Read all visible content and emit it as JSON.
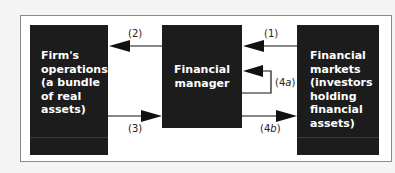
{
  "diagram": {
    "boxes": {
      "left": {
        "lines": [
          "Firm's",
          "operations",
          "(a bundle",
          "of real",
          "assets)"
        ]
      },
      "center": {
        "lines": [
          "Financial",
          "manager"
        ]
      },
      "right": {
        "lines": [
          "Financial",
          "markets",
          "(investors",
          "holding",
          "financial",
          "assets)"
        ]
      }
    },
    "arrows": {
      "a1": {
        "label": "(1)",
        "from": "right",
        "to": "center"
      },
      "a2": {
        "label": "(2)",
        "from": "center",
        "to": "left"
      },
      "a3": {
        "label": "(3)",
        "from": "left",
        "to": "center"
      },
      "a4a": {
        "label_prefix": "(4",
        "label_italic": "a",
        "label_suffix": ")",
        "from": "center",
        "to": "center"
      },
      "a4b": {
        "label_prefix": "(4",
        "label_italic": "b",
        "label_suffix": ")",
        "from": "center",
        "to": "right"
      }
    },
    "colors": {
      "box_fill": "#1c1c1c",
      "box_text": "#ffffff",
      "arrow": "#111111",
      "frame_border": "#8a8a8a",
      "background": "#f4f4f4"
    }
  }
}
